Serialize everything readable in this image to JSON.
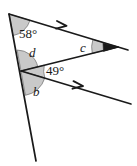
{
  "figure": {
    "kind": "geometry-angle-diagram",
    "width": 137,
    "height": 166,
    "background_color": "#ffffff",
    "stroke_color": "#1a1a1a",
    "angle_fill_color": "#c9c9c9",
    "angle_fill_stroke": "#555555"
  },
  "labels": {
    "apex_angle": "58°",
    "angle_d": "d",
    "angle_49": "49°",
    "angle_b": "b",
    "angle_c": "c"
  },
  "vertices": {
    "apex": {
      "name": "A",
      "x": 9,
      "y": 14
    },
    "middle": {
      "name": "B",
      "x": 21,
      "y": 71
    },
    "right": {
      "name": "C",
      "x": 118,
      "y": 47
    }
  },
  "segments": [
    {
      "name": "upper-ray",
      "from": [
        9,
        14
      ],
      "to": [
        118,
        47
      ],
      "arrow_marks": 1
    },
    {
      "name": "lower-ray",
      "from": [
        21,
        71
      ],
      "to": [
        131,
        104
      ],
      "arrow_marks": 1
    },
    {
      "name": "left-transversal",
      "from": [
        9,
        14
      ],
      "to": [
        36,
        161
      ],
      "arrow_marks": 0
    },
    {
      "name": "closing-side",
      "from": [
        21,
        71
      ],
      "to": [
        118,
        47
      ],
      "arrow_marks": 0
    }
  ],
  "arrow_markers": [
    {
      "name": "upper-arrow-marker",
      "x": 64,
      "y": 26
    },
    {
      "name": "lower-arrow-marker",
      "x": 80,
      "y": 86
    }
  ],
  "marked_angles": [
    {
      "name": "angle-58",
      "label": "58°",
      "vertex": "apex",
      "shaded": true
    },
    {
      "name": "angle-d",
      "label": "d",
      "vertex": "middle",
      "shaded": true
    },
    {
      "name": "angle-49",
      "label": "49°",
      "vertex": "middle",
      "shaded": true
    },
    {
      "name": "angle-b",
      "label": "b",
      "vertex": "middle",
      "shaded": true
    },
    {
      "name": "angle-c",
      "label": "c",
      "vertex": "right",
      "shaded": true
    }
  ]
}
